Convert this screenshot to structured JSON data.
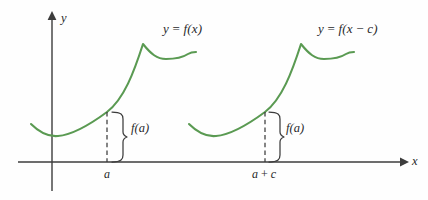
{
  "figure": {
    "kind": "math-graph-translation-diagram",
    "width": 428,
    "height": 200,
    "background_color": "#fefefe",
    "curve_color": "#5a9a52",
    "axis_color": "#3c3c3c",
    "text_color": "#28282a"
  },
  "axes": {
    "y_axis_label": "y",
    "x_axis_label": "x",
    "origin_x": 52,
    "baseline_y": 162
  },
  "curves": [
    {
      "id": "original",
      "equation_label": "y = f(x)",
      "equation_label_x": 163,
      "equation_label_y": 22,
      "color": "#5a9a52",
      "path": "M 31 124 C 40 133, 48 137, 58 136 C 72 135, 88 126, 107 112 C 124 99, 134 72, 143 44 C 151 54, 157 59, 166 59 C 174 59, 182 58, 188 54 C 191 52, 194 52, 196 52"
    },
    {
      "id": "shifted",
      "equation_label": "y = f(x − c)",
      "equation_label_x": 318,
      "equation_label_y": 22,
      "color": "#5a9a52",
      "path": "M 189 124 C 198 133, 206 137, 216 136 C 230 135, 246 126, 265 112 C 282 99, 292 72, 301 44 C 309 54, 315 59, 324 59 C 332 59, 340 58, 346 54 C 349 52, 352 52, 354 52"
    }
  ],
  "markers": [
    {
      "id": "marker-a",
      "tick_label": "a",
      "tick_label_x": 104,
      "tick_label_y": 168,
      "value_label": "f(a)",
      "value_label_x": 131,
      "value_label_y": 122,
      "drop_x": 107,
      "drop_top_y": 112,
      "drop_bottom_y": 162,
      "brace_x": 117
    },
    {
      "id": "marker-a-plus-c",
      "tick_label": "a + c",
      "tick_label_x": 252,
      "tick_label_y": 168,
      "value_label": "f(a)",
      "value_label_x": 286,
      "value_label_y": 122,
      "drop_x": 265,
      "drop_top_y": 112,
      "drop_bottom_y": 162,
      "brace_x": 274
    }
  ]
}
